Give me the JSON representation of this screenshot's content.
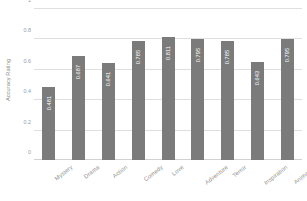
{
  "chart_data": {
    "type": "bar",
    "title": "",
    "xlabel": "",
    "ylabel": "Accuracy Rating",
    "categories": [
      "Mystery",
      "Drama",
      "Action",
      "Comedy",
      "Love",
      "Adventure",
      "Terror",
      "Inspiration",
      "Animation"
    ],
    "values": [
      0.481,
      0.687,
      0.641,
      0.785,
      0.811,
      0.795,
      0.785,
      0.643,
      0.795
    ],
    "value_labels": [
      "0.481",
      "0.687",
      "0.641",
      "0.785",
      "0.811",
      "0.795",
      "0.785",
      "0.643",
      "0.795"
    ],
    "ylim": [
      0,
      1
    ],
    "yticks": [
      0,
      0.2,
      0.4,
      0.6,
      0.8,
      1
    ],
    "ytick_labels": [
      "0",
      "0.2",
      "0.4",
      "0.6",
      "0.8",
      "1"
    ],
    "grid": true,
    "legend": false,
    "bar_color": "#7b7b7b",
    "value_label_color": "#ffffff",
    "gridline_color": "#dfdfdf",
    "background_color": "#ffffff"
  }
}
